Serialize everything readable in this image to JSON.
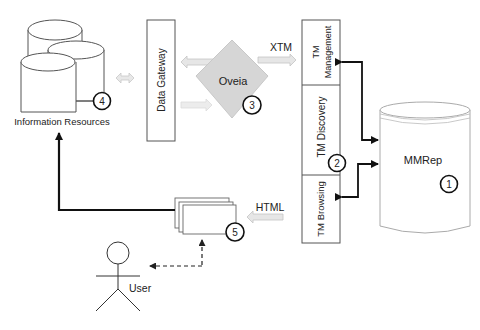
{
  "diagram": {
    "nodes": {
      "information_resources": {
        "label": "Information Resources",
        "number": "4"
      },
      "data_gateway": {
        "label": "Data Gateway"
      },
      "oveia": {
        "label": "Oveia",
        "number": "3"
      },
      "tm_management": {
        "label_line1": "TM",
        "label_line2": "Management"
      },
      "tm_discovery": {
        "label": "TM Discovery",
        "number": "2"
      },
      "tm_browsing": {
        "label": "TM Browsing"
      },
      "mmrep": {
        "label": "MMRep",
        "number": "1"
      },
      "html_pages": {
        "number": "5"
      },
      "user": {
        "label": "User"
      }
    },
    "edges": {
      "xtm": {
        "label": "XTM"
      },
      "html": {
        "label": "HTML"
      }
    },
    "colors": {
      "stroke": "#333333",
      "thick_arrow": "#111111",
      "gray_arrow_fill": "#e4e4e4",
      "gray_arrow_stroke": "#c4c4c4",
      "diamond_fill": "#d6d6d6",
      "background": "#ffffff"
    }
  }
}
